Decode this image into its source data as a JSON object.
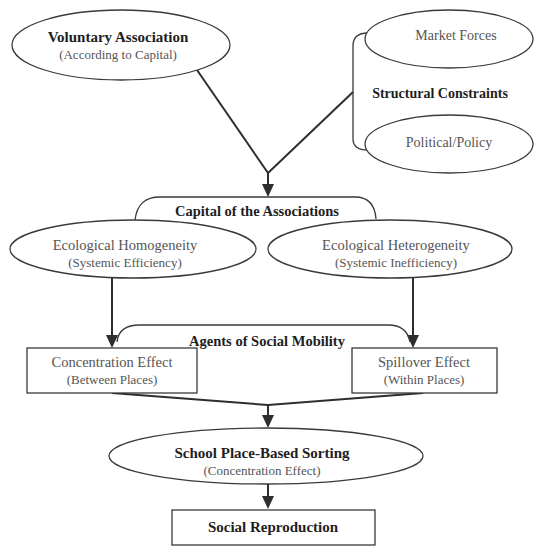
{
  "diagram": {
    "nodes": {
      "voluntary_association": {
        "title": "Voluntary Association",
        "subtitle": "(According to Capital)",
        "shape": "ellipse"
      },
      "market_forces": {
        "label": "Market Forces",
        "shape": "ellipse"
      },
      "political_policy": {
        "label": "Political/Policy",
        "shape": "ellipse"
      },
      "structural_constraints": {
        "label": "Structural Constraints",
        "shape": "bracket-label"
      },
      "capital_of_associations": {
        "label": "Capital of the Associations",
        "shape": "bracket-label"
      },
      "ecological_homogeneity": {
        "title": "Ecological Homogeneity",
        "subtitle": "(Systemic Efficiency)",
        "shape": "ellipse"
      },
      "ecological_heterogeneity": {
        "title": "Ecological Heterogeneity",
        "subtitle": "(Systemic Inefficiency)",
        "shape": "ellipse"
      },
      "agents_of_social_mobility": {
        "label": "Agents of Social Mobility",
        "shape": "bracket-label"
      },
      "concentration_effect": {
        "title": "Concentration Effect",
        "subtitle": "(Between Places)",
        "shape": "rectangle"
      },
      "spillover_effect": {
        "title": "Spillover Effect",
        "subtitle": "(Within Places)",
        "shape": "rectangle"
      },
      "school_sorting": {
        "title": "School Place-Based Sorting",
        "subtitle": "(Concentration Effect)",
        "shape": "ellipse"
      },
      "social_reproduction": {
        "label": "Social Reproduction",
        "shape": "rectangle"
      }
    },
    "edges": [
      {
        "from": "voluntary_association",
        "to": "capital_of_associations"
      },
      {
        "from": "structural_constraints",
        "to": "capital_of_associations"
      },
      {
        "from": "ecological_homogeneity",
        "to": "concentration_effect"
      },
      {
        "from": "ecological_heterogeneity",
        "to": "spillover_effect"
      },
      {
        "from": "concentration_effect",
        "to": "school_sorting"
      },
      {
        "from": "spillover_effect",
        "to": "school_sorting"
      },
      {
        "from": "school_sorting",
        "to": "social_reproduction"
      }
    ],
    "groups": [
      {
        "label_ref": "structural_constraints",
        "members": [
          "market_forces",
          "political_policy"
        ]
      },
      {
        "label_ref": "capital_of_associations",
        "members": [
          "ecological_homogeneity",
          "ecological_heterogeneity"
        ]
      },
      {
        "label_ref": "agents_of_social_mobility",
        "members": [
          "concentration_effect",
          "spillover_effect"
        ]
      }
    ],
    "colors": {
      "line": "#2e2e2e",
      "bold_text": "#1e1e1e",
      "regular_text": "#555555",
      "background": "#ffffff"
    }
  }
}
